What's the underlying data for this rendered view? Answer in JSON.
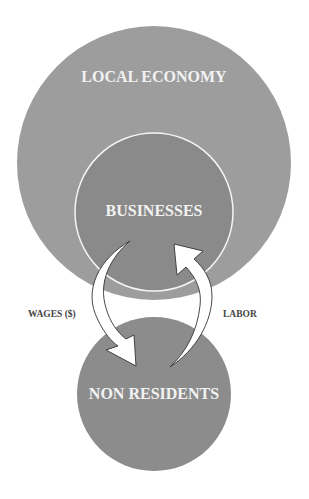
{
  "diagram": {
    "nodes": [
      {
        "id": "local_economy",
        "label": "LOCAL ECONOMY"
      },
      {
        "id": "businesses",
        "label": "BUSINESSES"
      },
      {
        "id": "non_residents",
        "label": "NON RESIDENTS"
      }
    ],
    "edges": [
      {
        "from": "businesses",
        "to": "non_residents",
        "label": "WAGES ($)"
      },
      {
        "from": "non_residents",
        "to": "businesses",
        "label": "LABOR"
      }
    ],
    "colors": {
      "outer_circle": "#9d9d9d",
      "inner_circle": "#8a8a8a",
      "bottom_circle": "#8c8c8c",
      "arrow_fill": "#ffffff",
      "arrow_stroke": "#333333",
      "node_text": "#f2f2f2",
      "edge_text": "#444444"
    }
  }
}
